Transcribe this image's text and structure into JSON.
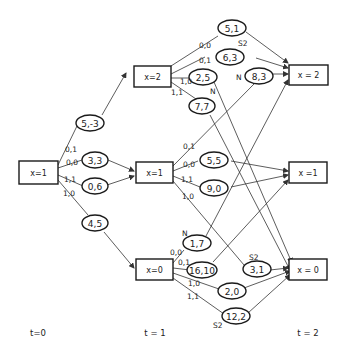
{
  "diagram": {
    "states_t0": [
      {
        "id": "s0",
        "label": "x=1"
      }
    ],
    "states_t1": [
      {
        "id": "a2",
        "label": "x=2"
      },
      {
        "id": "a1",
        "label": "x=1"
      },
      {
        "id": "a0",
        "label": "x=0"
      }
    ],
    "states_t2": [
      {
        "id": "b2",
        "label": "x = 2"
      },
      {
        "id": "b1",
        "label": "x =1"
      },
      {
        "id": "b0",
        "label": "x = 0"
      }
    ],
    "time_labels": [
      "t=0",
      "t = 1",
      "t = 2"
    ],
    "t0_actions": [
      {
        "action": "0,1",
        "payoff": "5,-3",
        "to": "x=2"
      },
      {
        "action": "0,0",
        "payoff": "3,3",
        "to": "x=1"
      },
      {
        "action": "1,1",
        "payoff": "0,6",
        "to": "x=1"
      },
      {
        "action": "1,0",
        "payoff": "4,5",
        "to": "x=0"
      }
    ],
    "from_x2": [
      {
        "action": "0,0",
        "payoff": "5,1",
        "tag": "S2",
        "to": "x=2"
      },
      {
        "action": "0,1",
        "payoff": "6,3",
        "tag": "",
        "to": "x=2"
      },
      {
        "action": "1,0",
        "payoff": "2,5",
        "tag": "N",
        "to": "x=0"
      },
      {
        "action": "1,1",
        "payoff": "7,7",
        "tag": "",
        "to": "x=0"
      }
    ],
    "from_x1": [
      {
        "action": "0,1",
        "payoff": "8,3",
        "tag": "N",
        "to": "x=2"
      },
      {
        "action": "0,0",
        "payoff": "5,5",
        "tag": "",
        "to": "x=1"
      },
      {
        "action": "1,1",
        "payoff": "9,0",
        "tag": "",
        "to": "x=1"
      },
      {
        "action": "1,0",
        "payoff": "3,1",
        "tag": "S2",
        "to": "x=0"
      }
    ],
    "from_x0": [
      {
        "action": "0,0",
        "payoff": "1,7",
        "tag": "N",
        "to": "x=2"
      },
      {
        "action": "0,1",
        "payoff": "16,10",
        "tag": "",
        "to": "x=1"
      },
      {
        "action": "1,0",
        "payoff": "2,0",
        "tag": "",
        "to": "x=0"
      },
      {
        "action": "1,1",
        "payoff": "12,2",
        "tag": "S2",
        "to": "x=0"
      }
    ],
    "tags": {
      "s2": "S2",
      "n": "N"
    }
  }
}
